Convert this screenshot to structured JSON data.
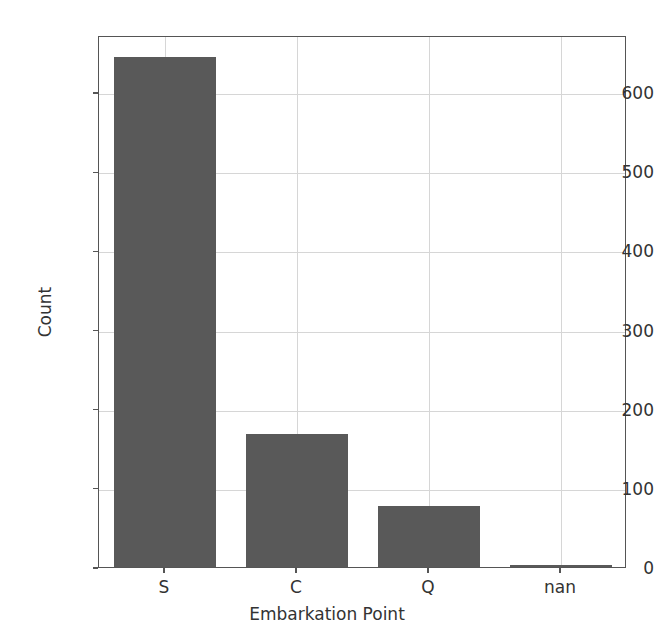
{
  "chart_data": {
    "type": "bar",
    "title": "",
    "xlabel": "Embarkation Point",
    "ylabel": "Count",
    "categories": [
      "S",
      "C",
      "Q",
      "nan"
    ],
    "values": [
      644,
      168,
      77,
      2
    ],
    "yticks": [
      0,
      100,
      200,
      300,
      400,
      500,
      600
    ],
    "ytick_labels": [
      "0",
      "100",
      "200",
      "300",
      "400",
      "500",
      "600"
    ],
    "ylim": [
      0,
      672
    ],
    "grid": true,
    "legend": "none",
    "bar_color": "#595959",
    "grid_color": "#d6d6d6",
    "axis_color": "#555555",
    "text_color": "#333333",
    "background": "#ffffff"
  }
}
